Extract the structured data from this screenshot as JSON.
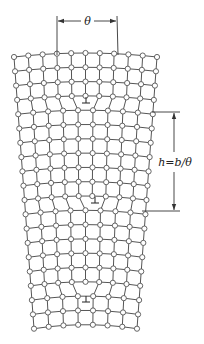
{
  "labels": {
    "angle": "θ",
    "height": "h=b/θ"
  },
  "lattice": {
    "top_y": 55,
    "row_spacing": 14.3,
    "rows": 20,
    "top_left_x": 14,
    "top_right_x": 157,
    "bottom_left_x": 34,
    "bottom_right_x": 137,
    "segments": [
      {
        "from_row": 0,
        "to_row": 3,
        "columns": 11
      },
      {
        "from_row": 4,
        "to_row": 10,
        "columns": 10
      },
      {
        "from_row": 11,
        "to_row": 16,
        "columns": 9
      },
      {
        "from_row": 17,
        "to_row": 19,
        "columns": 8
      }
    ],
    "dislocations": [
      {
        "row_between": [
          3,
          4
        ],
        "x": 86,
        "y": 103
      },
      {
        "row_between": [
          10,
          11
        ],
        "x": 95,
        "y": 203
      },
      {
        "row_between": [
          16,
          17
        ],
        "x": 86,
        "y": 302
      }
    ],
    "colors": {
      "line": "#555555",
      "atom_fill": "#ffffff"
    }
  },
  "annotations": {
    "theta_arrow": {
      "x1": 57,
      "x2": 117,
      "y": 21,
      "tick_top": 16,
      "tick_bottom": 55
    },
    "height_arrow": {
      "x": 174,
      "y1": 112,
      "y2": 211,
      "ext_left_top": 152,
      "ext_left_bottom": 142
    }
  }
}
